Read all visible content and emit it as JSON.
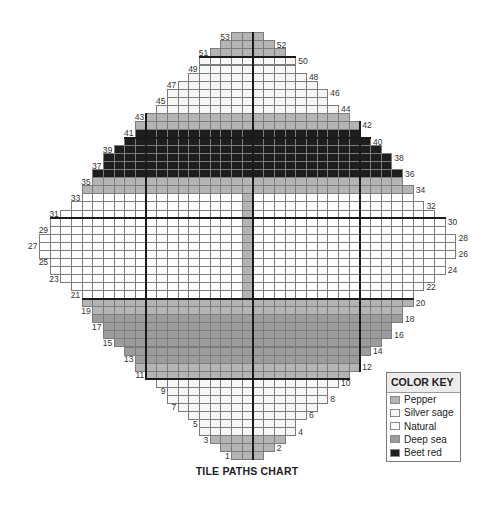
{
  "title": "TILE PATHS CHART",
  "color_key": {
    "heading": "COLOR KEY",
    "items": [
      {
        "id": "pepper",
        "label": "Pepper",
        "color": "#b4b4b4"
      },
      {
        "id": "silver_sage",
        "label": "Silver sage",
        "color": "#f6f6f4"
      },
      {
        "id": "natural",
        "label": "Natural",
        "color": "#ffffff"
      },
      {
        "id": "deep_sea",
        "label": "Deep sea",
        "color": "#9c9c9c"
      },
      {
        "id": "beet_red",
        "label": "Beet red",
        "color": "#1e1e1e"
      }
    ]
  },
  "grid": {
    "heavy_cols": [
      -10,
      0,
      10
    ],
    "heavy_rows_between": [
      10,
      20,
      30,
      40,
      50
    ],
    "overrides": [
      {
        "rows": [
          21,
          33
        ],
        "col": -1,
        "color": "pepper"
      }
    ],
    "rows": [
      {
        "n": 1,
        "label": "1",
        "label_side": "left",
        "start": -2,
        "end": 0,
        "color": "pepper"
      },
      {
        "n": 2,
        "label": "2",
        "label_side": "right",
        "start": -3,
        "end": 1,
        "color": "pepper"
      },
      {
        "n": 3,
        "label": "3",
        "label_side": "left",
        "start": -4,
        "end": 2,
        "color": "pepper"
      },
      {
        "n": 4,
        "label": "4",
        "label_side": "right",
        "start": -5,
        "end": 3,
        "color": "silver_sage"
      },
      {
        "n": 5,
        "label": "5",
        "label_side": "left",
        "start": -5,
        "end": 3,
        "color": "silver_sage"
      },
      {
        "n": 6,
        "label": "6",
        "label_side": "right",
        "start": -6,
        "end": 4,
        "color": "silver_sage"
      },
      {
        "n": 7,
        "label": "7",
        "label_side": "left",
        "start": -7,
        "end": 5,
        "color": "silver_sage"
      },
      {
        "n": 8,
        "label": "8",
        "label_side": "right",
        "start": -8,
        "end": 6,
        "color": "silver_sage"
      },
      {
        "n": 9,
        "label": "9",
        "label_side": "left",
        "start": -8,
        "end": 6,
        "color": "silver_sage"
      },
      {
        "n": 10,
        "label": "10",
        "label_side": "right",
        "start": -9,
        "end": 7,
        "color": "silver_sage"
      },
      {
        "n": 11,
        "label": "11",
        "label_side": "left",
        "start": -10,
        "end": 8,
        "color": "pepper"
      },
      {
        "n": 12,
        "label": "12",
        "label_side": "right",
        "start": -11,
        "end": 9,
        "color": "pepper"
      },
      {
        "n": 13,
        "label": "13",
        "label_side": "left",
        "start": -11,
        "end": 9,
        "color": "deep_sea"
      },
      {
        "n": 14,
        "label": "14",
        "label_side": "right",
        "start": -12,
        "end": 10,
        "color": "deep_sea"
      },
      {
        "n": 15,
        "label": "15",
        "label_side": "left",
        "start": -13,
        "end": 11,
        "color": "deep_sea"
      },
      {
        "n": 16,
        "label": "16",
        "label_side": "right",
        "start": -14,
        "end": 12,
        "color": "deep_sea"
      },
      {
        "n": 17,
        "label": "17",
        "label_side": "left",
        "start": -14,
        "end": 12,
        "color": "deep_sea"
      },
      {
        "n": 18,
        "label": "18",
        "label_side": "right",
        "start": -15,
        "end": 13,
        "color": "deep_sea"
      },
      {
        "n": 19,
        "label": "19",
        "label_side": "left",
        "start": -15,
        "end": 13,
        "color": "pepper"
      },
      {
        "n": 20,
        "label": "20",
        "label_side": "right",
        "start": -16,
        "end": 14,
        "color": "pepper"
      },
      {
        "n": 21,
        "label": "21",
        "label_side": "left",
        "start": -16,
        "end": 14,
        "color": "natural"
      },
      {
        "n": 22,
        "label": "22",
        "label_side": "right",
        "start": -17,
        "end": 15,
        "color": "natural"
      },
      {
        "n": 23,
        "label": "23",
        "label_side": "left",
        "start": -18,
        "end": 16,
        "color": "natural"
      },
      {
        "n": 24,
        "label": "24",
        "label_side": "right",
        "start": -19,
        "end": 17,
        "color": "natural"
      },
      {
        "n": 25,
        "label": "25",
        "label_side": "left",
        "start": -19,
        "end": 17,
        "color": "natural"
      },
      {
        "n": 26,
        "label": "26",
        "label_side": "right",
        "start": -20,
        "end": 18,
        "color": "natural"
      },
      {
        "n": 27,
        "label": "27",
        "label_side": "left",
        "start": -20,
        "end": 18,
        "color": "natural"
      },
      {
        "n": 28,
        "label": "28",
        "label_side": "right",
        "start": -20,
        "end": 18,
        "color": "natural"
      },
      {
        "n": 29,
        "label": "29",
        "label_side": "left",
        "start": -19,
        "end": 17,
        "color": "natural"
      },
      {
        "n": 30,
        "label": "30",
        "label_side": "right",
        "start": -19,
        "end": 17,
        "color": "natural"
      },
      {
        "n": 31,
        "label": "31",
        "label_side": "left",
        "start": -18,
        "end": 16,
        "color": "natural"
      },
      {
        "n": 32,
        "label": "32",
        "label_side": "right",
        "start": -17,
        "end": 15,
        "color": "natural"
      },
      {
        "n": 33,
        "label": "33",
        "label_side": "left",
        "start": -16,
        "end": 14,
        "color": "natural"
      },
      {
        "n": 34,
        "label": "34",
        "label_side": "right",
        "start": -16,
        "end": 14,
        "color": "pepper"
      },
      {
        "n": 35,
        "label": "35",
        "label_side": "left",
        "start": -15,
        "end": 13,
        "color": "pepper"
      },
      {
        "n": 36,
        "label": "36",
        "label_side": "right",
        "start": -15,
        "end": 13,
        "color": "beet_red"
      },
      {
        "n": 37,
        "label": "37",
        "label_side": "left",
        "start": -14,
        "end": 12,
        "color": "beet_red"
      },
      {
        "n": 38,
        "label": "38",
        "label_side": "right",
        "start": -14,
        "end": 12,
        "color": "beet_red"
      },
      {
        "n": 39,
        "label": "39",
        "label_side": "left",
        "start": -13,
        "end": 11,
        "color": "beet_red"
      },
      {
        "n": 40,
        "label": "40",
        "label_side": "right",
        "start": -12,
        "end": 10,
        "color": "beet_red"
      },
      {
        "n": 41,
        "label": "41",
        "label_side": "left",
        "start": -11,
        "end": 9,
        "color": "beet_red"
      },
      {
        "n": 42,
        "label": "42",
        "label_side": "right",
        "start": -11,
        "end": 9,
        "color": "pepper"
      },
      {
        "n": 43,
        "label": "43",
        "label_side": "left",
        "start": -10,
        "end": 8,
        "color": "pepper"
      },
      {
        "n": 44,
        "label": "44",
        "label_side": "right",
        "start": -9,
        "end": 7,
        "color": "silver_sage"
      },
      {
        "n": 45,
        "label": "45",
        "label_side": "left",
        "start": -8,
        "end": 6,
        "color": "silver_sage"
      },
      {
        "n": 46,
        "label": "46",
        "label_side": "right",
        "start": -8,
        "end": 6,
        "color": "silver_sage"
      },
      {
        "n": 47,
        "label": "47",
        "label_side": "left",
        "start": -7,
        "end": 5,
        "color": "silver_sage"
      },
      {
        "n": 48,
        "label": "48",
        "label_side": "right",
        "start": -6,
        "end": 4,
        "color": "silver_sage"
      },
      {
        "n": 49,
        "label": "49",
        "label_side": "left",
        "start": -5,
        "end": 3,
        "color": "silver_sage"
      },
      {
        "n": 50,
        "label": "50",
        "label_side": "right",
        "start": -5,
        "end": 3,
        "color": "silver_sage"
      },
      {
        "n": 51,
        "label": "51",
        "label_side": "left",
        "start": -4,
        "end": 2,
        "color": "pepper"
      },
      {
        "n": 52,
        "label": "52",
        "label_side": "right",
        "start": -3,
        "end": 1,
        "color": "pepper"
      },
      {
        "n": 53,
        "label": "53",
        "label_side": "left",
        "start": -2,
        "end": 0,
        "color": "pepper"
      }
    ]
  }
}
